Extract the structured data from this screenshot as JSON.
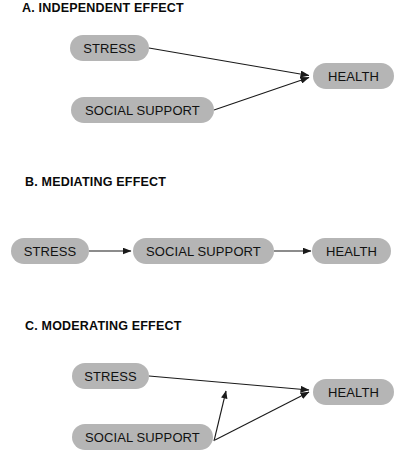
{
  "figure": {
    "background_color": "#ffffff",
    "box_fill_color": "#b5b5b5",
    "line_color": "#1a1a1a",
    "text_color": "#111111"
  },
  "panels": [
    {
      "id": "A",
      "heading": "A.  INDEPENDENT EFFECT",
      "nodes": [
        {
          "name": "stress",
          "label": "STRESS"
        },
        {
          "name": "social-support",
          "label": "SOCIAL SUPPORT"
        },
        {
          "name": "health",
          "label": "HEALTH"
        }
      ],
      "edges": [
        {
          "from": "STRESS",
          "to": "HEALTH",
          "style": "arrow"
        },
        {
          "from": "SOCIAL SUPPORT",
          "to": "HEALTH",
          "style": "arrow"
        }
      ]
    },
    {
      "id": "B",
      "heading": "B.  MEDIATING EFFECT",
      "nodes": [
        {
          "name": "stress",
          "label": "STRESS"
        },
        {
          "name": "social-support",
          "label": "SOCIAL SUPPORT"
        },
        {
          "name": "health",
          "label": "HEALTH"
        }
      ],
      "edges": [
        {
          "from": "STRESS",
          "to": "SOCIAL SUPPORT",
          "style": "arrow"
        },
        {
          "from": "SOCIAL SUPPORT",
          "to": "HEALTH",
          "style": "arrow"
        }
      ]
    },
    {
      "id": "C",
      "heading": "C.  MODERATING EFFECT",
      "nodes": [
        {
          "name": "stress",
          "label": "STRESS"
        },
        {
          "name": "social-support",
          "label": "SOCIAL SUPPORT"
        },
        {
          "name": "health",
          "label": "HEALTH"
        }
      ],
      "edges": [
        {
          "from": "STRESS",
          "to": "HEALTH",
          "style": "arrow"
        },
        {
          "from": "SOCIAL SUPPORT",
          "to": "HEALTH",
          "style": "arrow"
        },
        {
          "from": "SOCIAL SUPPORT",
          "to": "STRESS-HEALTH PATH",
          "style": "arrow"
        }
      ]
    }
  ]
}
